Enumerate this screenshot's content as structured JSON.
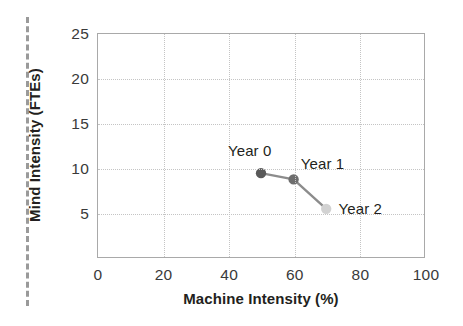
{
  "chart_data": {
    "type": "line",
    "title": "",
    "xlabel": "Machine Intensity (%)",
    "ylabel": "Mind Intensity (FTEs)",
    "xlim": [
      0,
      100
    ],
    "ylim": [
      0,
      25
    ],
    "xticks": [
      "0",
      "20",
      "40",
      "60",
      "80",
      "100"
    ],
    "yticks": [
      "5",
      "10",
      "15",
      "20",
      "25"
    ],
    "xtick_values": [
      0,
      20,
      40,
      60,
      80,
      100
    ],
    "ytick_values": [
      5,
      10,
      15,
      20,
      25
    ],
    "grid": true,
    "legend": "none",
    "series": [
      {
        "name": "Mind vs Machine trajectory",
        "points": [
          {
            "label": "Year 0",
            "x": 50,
            "y": 9.4,
            "color": "#595959"
          },
          {
            "label": "Year 1",
            "x": 60,
            "y": 8.7,
            "color": "#6e6e6e"
          },
          {
            "label": "Year 2",
            "x": 70,
            "y": 5.4,
            "color": "#d2d2d2"
          }
        ],
        "line_color": "#8c8c8c"
      }
    ],
    "annotations": [
      {
        "text": "Year 0",
        "x": 50,
        "y": 9.4,
        "placement": "above-left"
      },
      {
        "text": "Year 1",
        "x": 60,
        "y": 8.7,
        "placement": "above-right"
      },
      {
        "text": "Year 2",
        "x": 70,
        "y": 5.4,
        "placement": "right"
      }
    ]
  },
  "decorations": {
    "crop_rule": "vertical-dashed-guide"
  },
  "colors": {
    "axis": "#a9a9a9",
    "grid": "#c4c4c4",
    "text": "#231f20",
    "tick_text": "#3a3a3a",
    "guide": "#9a9a9a"
  }
}
